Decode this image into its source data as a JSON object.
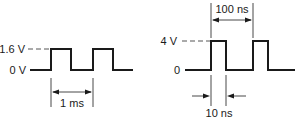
{
  "left_waveform": {
    "high_label": "1.6 V",
    "low_label": "0 V",
    "high_value_v": 1.6,
    "low_value_v": 0,
    "period_label": "1 ms",
    "pulse_count": 2,
    "duty_fraction": 0.5
  },
  "right_waveform": {
    "high_label": "4 V",
    "low_label": "0",
    "high_value_v": 4,
    "low_value_v": 0,
    "period_label": "100 ns",
    "pulse_width_label": "10 ns",
    "pulse_count": 2
  },
  "colors": {
    "line": "#1a1a1a",
    "background": "#ffffff"
  }
}
